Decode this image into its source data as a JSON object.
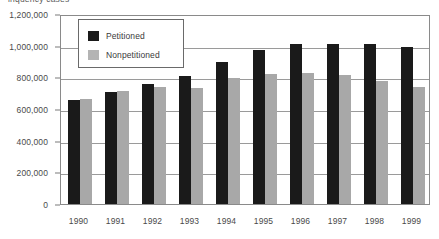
{
  "caption": "inquency cases",
  "chart_data": {
    "type": "bar",
    "title": "",
    "xlabel": "",
    "ylabel": "",
    "categories": [
      "1990",
      "1991",
      "1992",
      "1993",
      "1994",
      "1995",
      "1996",
      "1997",
      "1998",
      "1999"
    ],
    "series": [
      {
        "name": "Petitioned",
        "color": "#1a1a1a",
        "values": [
          655000,
          710000,
          755000,
          810000,
          898000,
          975000,
          1012000,
          1012000,
          1012000,
          990000
        ]
      },
      {
        "name": "Nonpetitioned",
        "color": "#a8a8a8",
        "values": [
          662000,
          715000,
          742000,
          735000,
          793000,
          818000,
          830000,
          815000,
          775000,
          738000
        ]
      }
    ],
    "ylim": [
      0,
      1200000
    ],
    "yticks": [
      0,
      200000,
      400000,
      600000,
      800000,
      1000000,
      1200000
    ],
    "ytick_labels": [
      "0",
      "200,000",
      "400,000",
      "600,000",
      "800,000",
      "1,000,000",
      "1,200,000"
    ],
    "grid": true,
    "legend_position": "top-left"
  }
}
